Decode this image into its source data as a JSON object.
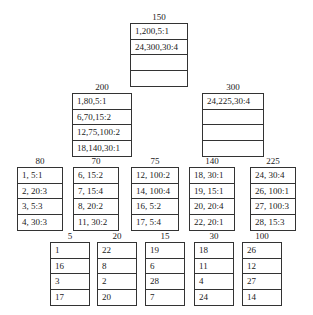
{
  "diagram": {
    "nodes": [
      {
        "id": "n150",
        "title": "150",
        "x": 130,
        "y": 12,
        "w": 58,
        "rows": [
          "1,200,5:1",
          "24,300,30:4",
          "",
          ""
        ]
      },
      {
        "id": "n200",
        "title": "200",
        "x": 72,
        "y": 82,
        "w": 60,
        "rows": [
          "1,80,5:1",
          "6,70,15:2",
          "12,75,100:2",
          "18,140,30:1"
        ]
      },
      {
        "id": "n300",
        "title": "300",
        "x": 202,
        "y": 82,
        "w": 62,
        "rows": [
          "24,225,30:4",
          "",
          "",
          ""
        ]
      },
      {
        "id": "n80",
        "title": "80",
        "x": 17,
        "y": 156,
        "w": 46,
        "rows": [
          "1, 5:1",
          "2, 20:3",
          "3, 5:3",
          "4, 30:3"
        ]
      },
      {
        "id": "n70",
        "title": "70",
        "x": 73,
        "y": 156,
        "w": 46,
        "rows": [
          "6, 15:2",
          "7, 15:4",
          "8, 20:2",
          "11, 30:2"
        ]
      },
      {
        "id": "n75",
        "title": "75",
        "x": 131,
        "y": 156,
        "w": 48,
        "rows": [
          "12, 100:2",
          "14, 100:4",
          "16, 5:2",
          "17, 5:4"
        ]
      },
      {
        "id": "n140",
        "title": "140",
        "x": 189,
        "y": 156,
        "w": 46,
        "rows": [
          "18, 30:1",
          "19, 15:1",
          "20, 20:4",
          "22, 20:1"
        ]
      },
      {
        "id": "n225",
        "title": "225",
        "x": 250,
        "y": 156,
        "w": 46,
        "rows": [
          "24, 30:4",
          "26, 100:1",
          "27, 100:3",
          "28, 15:3"
        ]
      },
      {
        "id": "n5",
        "title": "5",
        "x": 50,
        "y": 231,
        "w": 40,
        "rows": [
          "1",
          "16",
          "3",
          "17"
        ]
      },
      {
        "id": "n20",
        "title": "20",
        "x": 97,
        "y": 231,
        "w": 40,
        "rows": [
          "22",
          "8",
          "2",
          "20"
        ]
      },
      {
        "id": "n15",
        "title": "15",
        "x": 145,
        "y": 231,
        "w": 40,
        "rows": [
          "19",
          "6",
          "28",
          "7"
        ]
      },
      {
        "id": "n30",
        "title": "30",
        "x": 194,
        "y": 231,
        "w": 40,
        "rows": [
          "18",
          "11",
          "4",
          "24"
        ]
      },
      {
        "id": "n100",
        "title": "100",
        "x": 242,
        "y": 231,
        "w": 40,
        "rows": [
          "26",
          "12",
          "27",
          "14"
        ]
      }
    ]
  }
}
